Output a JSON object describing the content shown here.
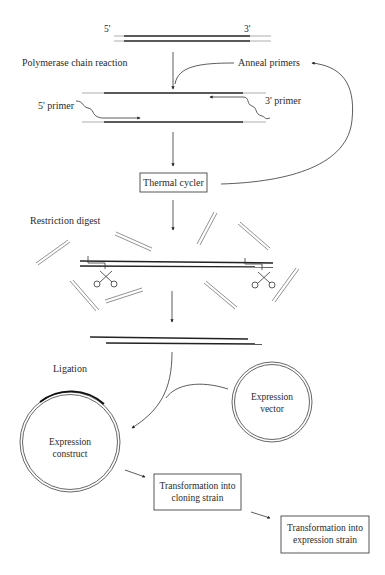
{
  "diagram": {
    "template_strand": {
      "five_prime_label": "5'",
      "three_prime_label": "3'"
    },
    "steps": {
      "pcr": {
        "label": "Polymerase chain reaction"
      },
      "anneal": {
        "label": "Anneal primers"
      },
      "primer_5": {
        "label": "5' primer"
      },
      "primer_3": {
        "label": "3' primer"
      },
      "thermal_cycler": {
        "label": "Thermal cycler"
      },
      "restriction_digest": {
        "label": "Restriction digest"
      },
      "ligation": {
        "label": "Ligation"
      },
      "expression_vector": {
        "line1": "Expression",
        "line2": "vector"
      },
      "expression_construct": {
        "line1": "Expression",
        "line2": "construct"
      },
      "transform_cloning": {
        "line1": "Transformation into",
        "line2": "cloning strain"
      },
      "transform_expression": {
        "line1": "Transformation into",
        "line2": "expression strain"
      }
    },
    "colors": {
      "line": "#222222",
      "text": "#2a2a2a",
      "background": "#ffffff"
    }
  }
}
